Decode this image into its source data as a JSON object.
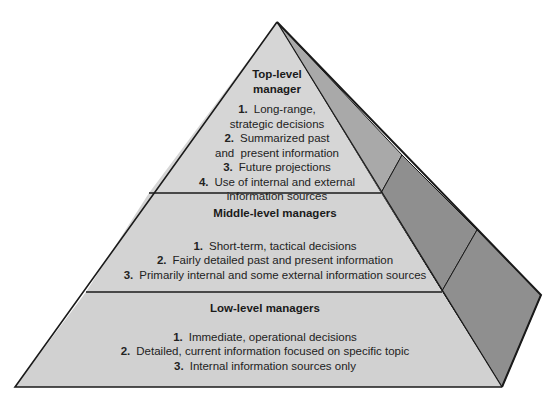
{
  "diagram": {
    "type": "pyramid",
    "colors": {
      "front_face": "#d4d4d4",
      "side_face_top": "#a9a9a9",
      "side_face_lower": "#8f8f8f",
      "edge": "#1a1a1a",
      "background": "#ffffff"
    },
    "tiers": [
      {
        "id": "top",
        "title_line1": "Top-level",
        "title_line2": "manager",
        "items": [
          {
            "num": "1.",
            "line1": "Long-range,",
            "line2": "strategic decisions"
          },
          {
            "num": "2.",
            "line1": "Summarized past",
            "line2": "and  present information"
          },
          {
            "num": "3.",
            "line1": "Future projections",
            "line2": ""
          },
          {
            "num": "4.",
            "line1": "Use of internal and external",
            "line2": "information sources"
          }
        ]
      },
      {
        "id": "middle",
        "title": "Middle-level managers",
        "items": [
          {
            "num": "1.",
            "text": "Short-term, tactical decisions"
          },
          {
            "num": "2.",
            "text": "Fairly detailed past and present  information"
          },
          {
            "num": "3.",
            "text": "Primarily internal and some external information sources"
          }
        ]
      },
      {
        "id": "bottom",
        "title": "Low-level managers",
        "items": [
          {
            "num": "1.",
            "text": "Immediate, operational decisions"
          },
          {
            "num": "2.",
            "text": "Detailed, current information focused on specific topic"
          },
          {
            "num": "3.",
            "text": "Internal information sources only"
          }
        ]
      }
    ]
  }
}
